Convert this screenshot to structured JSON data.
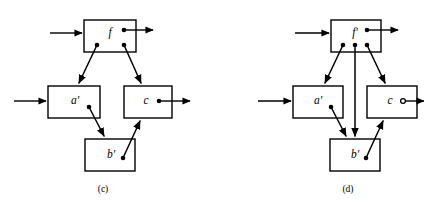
{
  "figure": {
    "background_color": "#ffffff",
    "ink_color": "#000000",
    "width": 424,
    "height": 205
  },
  "panels": [
    {
      "id": "panel-c",
      "caption": "(c)",
      "caption_x": 103,
      "caption_y": 190,
      "nodes": [
        {
          "id": "f",
          "label": "f",
          "x": 84,
          "y": 20,
          "w": 52,
          "h": 32,
          "label_x": 110,
          "label_y": 33
        },
        {
          "id": "a1",
          "label": "a'",
          "x": 48,
          "y": 86,
          "w": 52,
          "h": 32,
          "label_x": 75,
          "label_y": 101
        },
        {
          "id": "c",
          "label": "c",
          "x": 124,
          "y": 86,
          "w": 48,
          "h": 32,
          "label_x": 146,
          "label_y": 101
        },
        {
          "id": "b1",
          "label": "b'",
          "x": 85,
          "y": 139,
          "w": 50,
          "h": 32,
          "label_x": 111,
          "label_y": 155
        }
      ],
      "ports": [
        {
          "id": "f-out",
          "type": "dot",
          "x": 124,
          "y": 30
        },
        {
          "id": "f-low-l",
          "type": "dot",
          "x": 97,
          "y": 45
        },
        {
          "id": "f-low-r",
          "type": "dot",
          "x": 124,
          "y": 45
        },
        {
          "id": "a1-out",
          "type": "dot",
          "x": 89,
          "y": 107
        },
        {
          "id": "c-out",
          "type": "dot",
          "x": 159,
          "y": 101
        },
        {
          "id": "b1-out",
          "type": "dot",
          "x": 123,
          "y": 158
        }
      ],
      "links": [
        {
          "id": "f-to-a1",
          "from": "f",
          "to": "a1",
          "x1": 97,
          "y1": 45,
          "x2": 79,
          "y2": 83
        },
        {
          "id": "f-to-c",
          "from": "f",
          "to": "c",
          "x1": 124,
          "y1": 45,
          "x2": 141,
          "y2": 83
        },
        {
          "id": "a1-to-b1",
          "from": "a1",
          "to": "b1",
          "x1": 89,
          "y1": 107,
          "x2": 104,
          "y2": 136
        },
        {
          "id": "b1-to-c",
          "from": "b1",
          "to": "c",
          "x1": 123,
          "y1": 158,
          "x2": 140,
          "y2": 121
        }
      ],
      "io": [
        {
          "id": "input-f",
          "kind": "input",
          "x1": 50,
          "y1": 33,
          "x2": 82,
          "y2": 33
        },
        {
          "id": "output-f",
          "kind": "output",
          "x1": 124,
          "y1": 30,
          "x2": 153,
          "y2": 30
        },
        {
          "id": "input-a1",
          "kind": "input",
          "x1": 14,
          "y1": 101,
          "x2": 46,
          "y2": 101
        },
        {
          "id": "output-c",
          "kind": "output",
          "x1": 159,
          "y1": 101,
          "x2": 190,
          "y2": 101
        }
      ]
    },
    {
      "id": "panel-d",
      "caption": "(d)",
      "caption_x": 348,
      "caption_y": 190,
      "nodes": [
        {
          "id": "f1",
          "label": "f'",
          "x": 331,
          "y": 20,
          "w": 50,
          "h": 32,
          "label_x": 355,
          "label_y": 33
        },
        {
          "id": "a1",
          "label": "a'",
          "x": 293,
          "y": 86,
          "w": 50,
          "h": 32,
          "label_x": 318,
          "label_y": 101
        },
        {
          "id": "c",
          "label": "c",
          "x": 367,
          "y": 86,
          "w": 50,
          "h": 32,
          "label_x": 390,
          "label_y": 101
        },
        {
          "id": "b1",
          "label": "b'",
          "x": 330,
          "y": 139,
          "w": 50,
          "h": 32,
          "label_x": 355,
          "label_y": 155
        }
      ],
      "ports": [
        {
          "id": "f1-out",
          "type": "dot",
          "x": 367,
          "y": 30
        },
        {
          "id": "f1-low-l",
          "type": "dot",
          "x": 343,
          "y": 45
        },
        {
          "id": "f1-low-m",
          "type": "dot",
          "x": 355,
          "y": 45
        },
        {
          "id": "f1-low-r",
          "type": "dot",
          "x": 367,
          "y": 45
        },
        {
          "id": "a1-out",
          "type": "dot",
          "x": 331,
          "y": 107
        },
        {
          "id": "c-out",
          "type": "ring",
          "x": 403,
          "y": 101
        },
        {
          "id": "b1-out",
          "type": "dot",
          "x": 366,
          "y": 158
        }
      ],
      "links": [
        {
          "id": "f1-to-a1",
          "from": "f1",
          "to": "a1",
          "x1": 343,
          "y1": 45,
          "x2": 325,
          "y2": 83
        },
        {
          "id": "f1-to-b1",
          "from": "f1",
          "to": "b1",
          "x1": 355,
          "y1": 45,
          "x2": 355,
          "y2": 136
        },
        {
          "id": "f1-to-c",
          "from": "f1",
          "to": "c",
          "x1": 367,
          "y1": 45,
          "x2": 385,
          "y2": 83
        },
        {
          "id": "a1-to-b1",
          "from": "a1",
          "to": "b1",
          "x1": 331,
          "y1": 107,
          "x2": 346,
          "y2": 136
        },
        {
          "id": "b1-to-c",
          "from": "b1",
          "to": "c",
          "x1": 366,
          "y1": 158,
          "x2": 383,
          "y2": 121
        }
      ],
      "io": [
        {
          "id": "input-f1",
          "kind": "input",
          "x1": 295,
          "y1": 33,
          "x2": 329,
          "y2": 33
        },
        {
          "id": "output-f1",
          "kind": "output",
          "x1": 367,
          "y1": 30,
          "x2": 398,
          "y2": 30
        },
        {
          "id": "input-a1",
          "kind": "input",
          "x1": 258,
          "y1": 101,
          "x2": 291,
          "y2": 101
        },
        {
          "id": "output-c",
          "kind": "output",
          "x1": 403,
          "y1": 101,
          "x2": 424,
          "y2": 101
        }
      ]
    }
  ]
}
